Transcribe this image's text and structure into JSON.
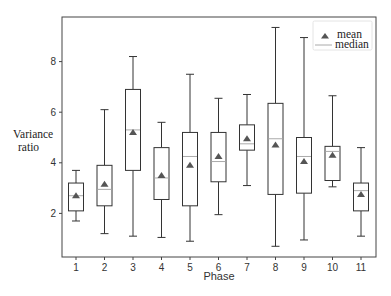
{
  "chart_data": {
    "type": "box",
    "title": "",
    "xlabel": "Phase",
    "ylabel": "Variance ratio",
    "ylabel_lines": [
      "Variance",
      "ratio"
    ],
    "categories": [
      "1",
      "2",
      "3",
      "4",
      "5",
      "6",
      "7",
      "8",
      "9",
      "10",
      "11"
    ],
    "yticks": [
      2,
      4,
      6,
      8
    ],
    "ylim": [
      0.3,
      9.8
    ],
    "grid": false,
    "legend": {
      "position": "upper right",
      "entries": [
        {
          "label": "mean",
          "marker": "triangle",
          "color": "#555555"
        },
        {
          "label": "median",
          "marker": "line",
          "color": "#aaaaaa"
        }
      ]
    },
    "series": [
      {
        "category": "1",
        "whisker_low": 1.7,
        "q1": 2.1,
        "median": 2.7,
        "q3": 3.2,
        "whisker_high": 3.7,
        "mean": 2.7
      },
      {
        "category": "2",
        "whisker_low": 1.2,
        "q1": 2.3,
        "median": 2.95,
        "q3": 3.9,
        "whisker_high": 6.1,
        "mean": 3.15
      },
      {
        "category": "3",
        "whisker_low": 1.1,
        "q1": 3.7,
        "median": 5.3,
        "q3": 6.9,
        "whisker_high": 8.2,
        "mean": 5.2
      },
      {
        "category": "4",
        "whisker_low": 1.05,
        "q1": 2.55,
        "median": 3.4,
        "q3": 4.6,
        "whisker_high": 5.6,
        "mean": 3.5
      },
      {
        "category": "5",
        "whisker_low": 0.9,
        "q1": 2.3,
        "median": 4.25,
        "q3": 5.2,
        "whisker_high": 7.5,
        "mean": 3.9
      },
      {
        "category": "6",
        "whisker_low": 1.95,
        "q1": 3.25,
        "median": 4.05,
        "q3": 5.2,
        "whisker_high": 6.55,
        "mean": 4.25
      },
      {
        "category": "7",
        "whisker_low": 3.1,
        "q1": 4.5,
        "median": 4.75,
        "q3": 5.5,
        "whisker_high": 6.7,
        "mean": 4.95
      },
      {
        "category": "8",
        "whisker_low": 0.7,
        "q1": 2.75,
        "median": 4.95,
        "q3": 6.35,
        "whisker_high": 9.35,
        "mean": 4.7
      },
      {
        "category": "9",
        "whisker_low": 0.95,
        "q1": 2.8,
        "median": 4.25,
        "q3": 5.0,
        "whisker_high": 8.95,
        "mean": 4.05
      },
      {
        "category": "10",
        "whisker_low": 3.05,
        "q1": 3.3,
        "median": 4.45,
        "q3": 4.65,
        "whisker_high": 6.65,
        "mean": 4.3
      },
      {
        "category": "11",
        "whisker_low": 1.1,
        "q1": 2.1,
        "median": 2.9,
        "q3": 3.2,
        "whisker_high": 4.6,
        "mean": 2.75
      }
    ]
  },
  "colors": {
    "frame": "#444444",
    "box_edge": "#333333",
    "median": "#aaaaaa",
    "mean": "#555555"
  }
}
